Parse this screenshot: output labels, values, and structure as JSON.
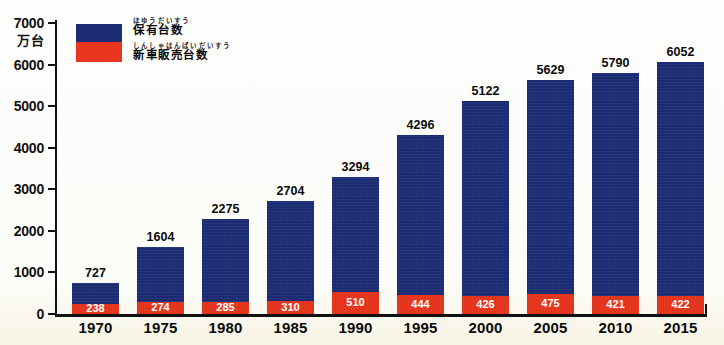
{
  "chart_data": {
    "type": "bar",
    "title": "",
    "unit_label": "万台",
    "categories": [
      "1970",
      "1975",
      "1980",
      "1985",
      "1990",
      "1995",
      "2000",
      "2005",
      "2010",
      "2015"
    ],
    "series": [
      {
        "name": "保有台数",
        "furigana": "ほゆうだいすう",
        "color": "#1c2d76",
        "label_style": "black-above-bar",
        "values": [
          727,
          1604,
          2275,
          2704,
          3294,
          4296,
          5122,
          5629,
          5790,
          6052
        ]
      },
      {
        "name": "新車販売台数",
        "furigana": "しんしゃはんばいだいすう",
        "color": "#e9371f",
        "label_style": "white-inside-bar",
        "values": [
          238,
          274,
          285,
          310,
          510,
          444,
          426,
          475,
          421,
          422
        ]
      }
    ],
    "ylim": [
      0,
      7000
    ],
    "ytick_interval": 1000,
    "ytick_labels": [
      "7000",
      "6000",
      "5000",
      "4000",
      "3000",
      "2000",
      "1000",
      "0"
    ],
    "legend_position": "top-left",
    "grid": false,
    "bar_style": "overlaid-stack"
  },
  "colors": {
    "bar_blue": "#1c2d76",
    "bar_red": "#e9371f",
    "axis": "#111111",
    "inside_label": "#ffffff",
    "background": "#fcfcf8"
  }
}
